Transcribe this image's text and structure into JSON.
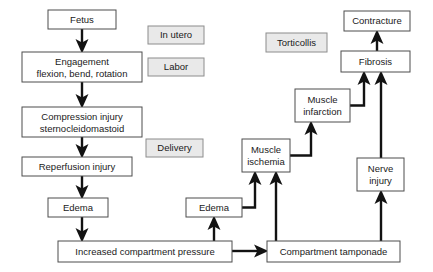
{
  "diagram": {
    "colors": {
      "node_fill": "#ffffff",
      "node_stroke": "#4d4d4d",
      "stage_fill": "#e9e9e9",
      "stage_stroke": "#8c8c8c",
      "arrow": "#121212",
      "background": "#ffffff"
    },
    "nodes": [
      {
        "id": "fetus",
        "label": "Fetus",
        "lines": [
          "Fetus"
        ],
        "x": 48,
        "y": 10,
        "w": 68,
        "h": 19,
        "kind": "process"
      },
      {
        "id": "engagement",
        "label": "Engagement flexion, bend, rotation",
        "lines": [
          "Engagement",
          "flexion, bend, rotation"
        ],
        "x": 22,
        "y": 52,
        "w": 120,
        "h": 30,
        "kind": "process"
      },
      {
        "id": "compression",
        "label": "Compression injury sternocleidomastoid",
        "lines": [
          "Compression injury",
          "sternocleidomastoid"
        ],
        "x": 22,
        "y": 107,
        "w": 120,
        "h": 30,
        "kind": "process"
      },
      {
        "id": "reperfusion",
        "label": "Reperfusion injury",
        "lines": [
          "Reperfusion injury"
        ],
        "x": 22,
        "y": 157,
        "w": 110,
        "h": 19,
        "kind": "process"
      },
      {
        "id": "edema-left",
        "label": "Edema",
        "lines": [
          "Edema"
        ],
        "x": 48,
        "y": 198,
        "w": 60,
        "h": 19,
        "kind": "process"
      },
      {
        "id": "increased-pressure",
        "label": "Increased compartment pressure",
        "lines": [
          "Increased compartment pressure"
        ],
        "x": 58,
        "y": 241,
        "w": 174,
        "h": 21,
        "kind": "process"
      },
      {
        "id": "edema-right",
        "label": "Edema",
        "lines": [
          "Edema"
        ],
        "x": 186,
        "y": 198,
        "w": 56,
        "h": 19,
        "kind": "process"
      },
      {
        "id": "muscle-ischemia",
        "label": "Muscle ischemia",
        "lines": [
          "Muscle",
          "ischemia"
        ],
        "x": 242,
        "y": 139,
        "w": 48,
        "h": 33,
        "kind": "process"
      },
      {
        "id": "muscle-infarction",
        "label": "Muscle infarction",
        "lines": [
          "Muscle",
          "infarction"
        ],
        "x": 295,
        "y": 89,
        "w": 55,
        "h": 33,
        "kind": "process"
      },
      {
        "id": "compartment-tamponade",
        "label": "Compartment tamponade",
        "lines": [
          "Compartment tamponade"
        ],
        "x": 267,
        "y": 241,
        "w": 133,
        "h": 21,
        "kind": "process"
      },
      {
        "id": "nerve-injury",
        "label": "Nerve injury",
        "lines": [
          "Nerve",
          "injury"
        ],
        "x": 357,
        "y": 158,
        "w": 47,
        "h": 33,
        "kind": "process"
      },
      {
        "id": "fibrosis",
        "label": "Fibrosis",
        "lines": [
          "Fibrosis"
        ],
        "x": 341,
        "y": 51,
        "w": 69,
        "h": 21,
        "kind": "process"
      },
      {
        "id": "contracture",
        "label": "Contracture",
        "lines": [
          "Contracture"
        ],
        "x": 344,
        "y": 11,
        "w": 66,
        "h": 20,
        "kind": "process"
      }
    ],
    "stages": [
      {
        "id": "in-utero",
        "label": "In utero",
        "x": 148,
        "y": 26,
        "w": 56,
        "h": 18
      },
      {
        "id": "labor",
        "label": "Labor",
        "x": 148,
        "y": 58,
        "w": 56,
        "h": 18
      },
      {
        "id": "delivery",
        "label": "Delivery",
        "x": 146,
        "y": 139,
        "w": 57,
        "h": 18
      },
      {
        "id": "torticollis",
        "label": "Torticollis",
        "x": 266,
        "y": 33,
        "w": 61,
        "h": 19
      }
    ],
    "edges": [
      {
        "id": "fetus-to-engagement",
        "from": "fetus",
        "to": "engagement"
      },
      {
        "id": "engagement-to-compression",
        "from": "engagement",
        "to": "compression"
      },
      {
        "id": "compression-to-reperfusion",
        "from": "compression",
        "to": "reperfusion"
      },
      {
        "id": "reperfusion-to-edema",
        "from": "reperfusion",
        "to": "edema-left"
      },
      {
        "id": "edema-to-increased-pressure",
        "from": "edema-left",
        "to": "increased-pressure"
      },
      {
        "id": "increased-pressure-to-tamponade",
        "from": "increased-pressure",
        "to": "compartment-tamponade"
      },
      {
        "id": "increased-pressure-to-edema-right",
        "from": "increased-pressure",
        "to": "edema-right"
      },
      {
        "id": "edema-right-to-muscle-ischemia",
        "from": "edema-right",
        "to": "muscle-ischemia"
      },
      {
        "id": "tamponade-to-muscle-ischemia",
        "from": "compartment-tamponade",
        "to": "muscle-ischemia"
      },
      {
        "id": "muscle-ischemia-to-muscle-infarction",
        "from": "muscle-ischemia",
        "to": "muscle-infarction"
      },
      {
        "id": "muscle-infarction-to-fibrosis",
        "from": "muscle-infarction",
        "to": "fibrosis"
      },
      {
        "id": "tamponade-to-nerve-injury",
        "from": "compartment-tamponade",
        "to": "nerve-injury"
      },
      {
        "id": "nerve-injury-to-fibrosis",
        "from": "nerve-injury",
        "to": "fibrosis"
      },
      {
        "id": "fibrosis-to-contracture",
        "from": "fibrosis",
        "to": "contracture"
      }
    ]
  }
}
